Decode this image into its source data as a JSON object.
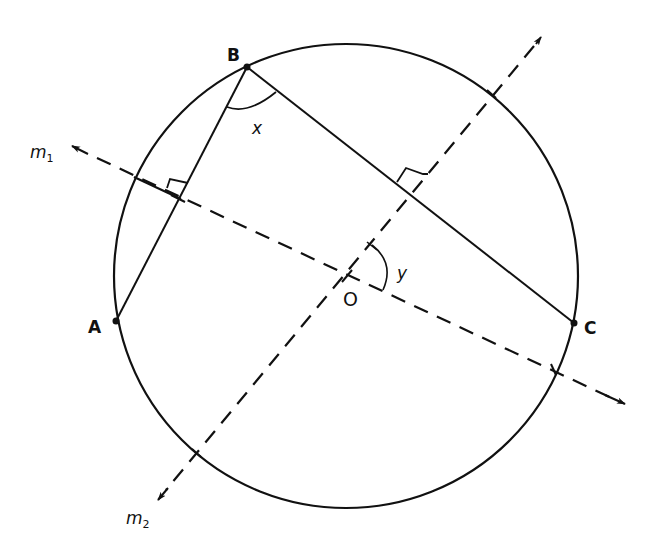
{
  "figure": {
    "type": "geometry-diagram",
    "colors": {
      "stroke": "#111111",
      "background": "#ffffff"
    }
  },
  "circle": {
    "center_label": "O",
    "cx": 346,
    "cy": 276,
    "r": 232
  },
  "points": {
    "A": {
      "label": "A",
      "x": 116,
      "y": 321
    },
    "B": {
      "label": "B",
      "x": 247,
      "y": 67
    },
    "C": {
      "label": "C",
      "x": 574,
      "y": 323
    },
    "O": {
      "label": "O",
      "x": 347,
      "y": 276
    }
  },
  "segments": [
    "AB",
    "BC"
  ],
  "lines": {
    "m1": {
      "label": "m",
      "subscript": "1",
      "style": "dashed",
      "perpendicular_to": "AB",
      "from": [
        70,
        145
      ],
      "to": [
        627,
        405
      ]
    },
    "m2": {
      "label": "m",
      "subscript": "2",
      "style": "dashed",
      "perpendicular_to": "BC",
      "from": [
        543,
        34
      ],
      "to": [
        156,
        503
      ]
    }
  },
  "angles": {
    "x": {
      "label": "x",
      "vertex": "B",
      "between": [
        "BA",
        "BC"
      ]
    },
    "y": {
      "label": "y",
      "vertex": "O",
      "between": [
        "m2",
        "m1"
      ]
    }
  },
  "right_angle_marks": 2
}
